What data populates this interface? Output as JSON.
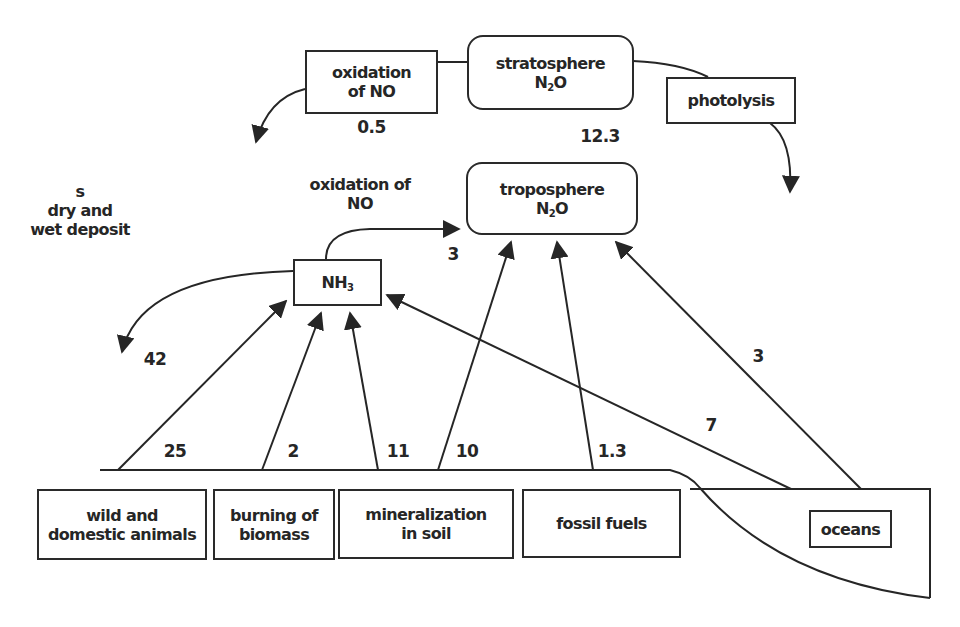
{
  "diagram": {
    "type": "nitrogen cycle flow diagram",
    "nodes": {
      "stratosphere": {
        "line1": "stratosphere",
        "line2_main": "N",
        "line2_sub": "2",
        "line2_tail": "O"
      },
      "troposphere": {
        "line1": "troposphere",
        "line2_main": "N",
        "line2_sub": "2",
        "line2_tail": "O"
      },
      "oxidation_top": {
        "line1": "oxidation",
        "line2": "of NO"
      },
      "photolysis": {
        "label": "photolysis"
      },
      "nh3": {
        "main": "NH",
        "sub": "3"
      },
      "oxidation_mid": {
        "line1": "oxidation of",
        "line2": "NO"
      },
      "deposit": {
        "line1": "s",
        "line2": "dry and",
        "line3": "wet deposit"
      },
      "sources": [
        {
          "line1": "wild and",
          "line2": "domestic animals"
        },
        {
          "line1": "burning of",
          "line2": "biomass"
        },
        {
          "line1": "mineralization",
          "line2": "in soil"
        },
        {
          "line1": "fossil fuels",
          "line2": ""
        },
        {
          "line1": "oceans",
          "line2": ""
        }
      ]
    },
    "flow_values": {
      "oxidation_of_no_top": "0.5",
      "strat_to_trop": "12.3",
      "nh3_to_trop": "3",
      "deposition": "42",
      "animals_to_nh3": "25",
      "biomass_to_nh3": "2",
      "soil_to_nh3": "11",
      "soil_to_trop": "10",
      "fossil_to_trop": "1.3",
      "oceans_to_nh3": "7",
      "oceans_to_trop": "3"
    },
    "colors": {
      "ink": "#262626",
      "background": "#ffffff"
    }
  }
}
